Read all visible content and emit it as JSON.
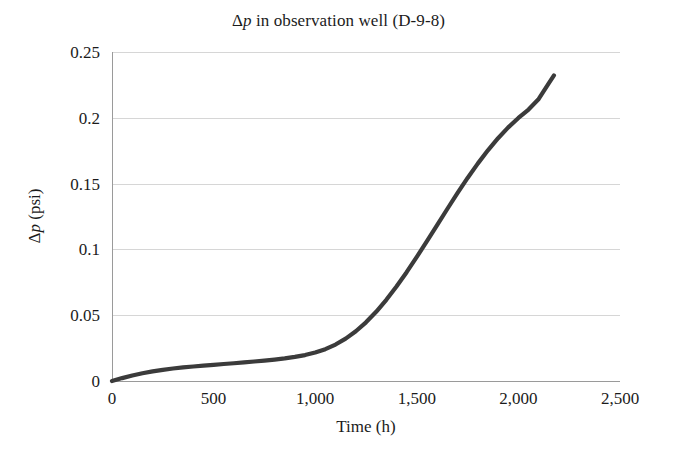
{
  "chart_data": {
    "type": "line",
    "title": "Δp in observation well (D-9-8)",
    "title_parts": {
      "delta": "Δ",
      "italic_symbol": "p",
      "rest": " in observation well (D-9-8)"
    },
    "xlabel": "Time (h)",
    "ylabel": "Δp (psi)",
    "ylabel_parts": {
      "delta": "Δ",
      "italic_symbol": "p",
      "rest": " (psi)"
    },
    "xlim": [
      0,
      2500
    ],
    "ylim": [
      0,
      0.25
    ],
    "xticks": [
      0,
      500,
      1000,
      1500,
      2000,
      2500
    ],
    "xtick_labels": [
      "0",
      "500",
      "1,000",
      "1,500",
      "2,000",
      "2,500"
    ],
    "yticks": [
      0,
      0.05,
      0.1,
      0.15,
      0.2,
      0.25
    ],
    "ytick_labels": [
      "0",
      "0.05",
      "0.1",
      "0.15",
      "0.2",
      "0.25"
    ],
    "grid": "horizontal",
    "legend": null,
    "series": [
      {
        "name": "Δp observation well D-9-8",
        "color": "#3b3b3b",
        "line_width": 4.2,
        "x": [
          0,
          50,
          100,
          150,
          200,
          250,
          300,
          350,
          400,
          450,
          500,
          550,
          600,
          650,
          700,
          750,
          800,
          850,
          900,
          950,
          1000,
          1050,
          1100,
          1150,
          1200,
          1250,
          1300,
          1350,
          1400,
          1450,
          1500,
          1550,
          1600,
          1650,
          1700,
          1750,
          1800,
          1850,
          1900,
          1950,
          2000,
          2050,
          2100,
          2150,
          2175
        ],
        "y": [
          0.0,
          0.0022,
          0.0042,
          0.0059,
          0.0073,
          0.0085,
          0.0095,
          0.0103,
          0.011,
          0.0117,
          0.0123,
          0.0129,
          0.0135,
          0.0141,
          0.0148,
          0.0155,
          0.0163,
          0.0172,
          0.0183,
          0.0197,
          0.0216,
          0.0242,
          0.0277,
          0.0322,
          0.0378,
          0.0446,
          0.0526,
          0.0617,
          0.0718,
          0.0827,
          0.0943,
          0.1063,
          0.1185,
          0.1307,
          0.1427,
          0.1543,
          0.1652,
          0.1753,
          0.1845,
          0.1927,
          0.1999,
          0.2063,
          0.2143,
          0.2263,
          0.2322
        ]
      }
    ]
  },
  "plot_geometry": {
    "left": 112,
    "right": 620,
    "top": 52,
    "bottom": 381
  }
}
